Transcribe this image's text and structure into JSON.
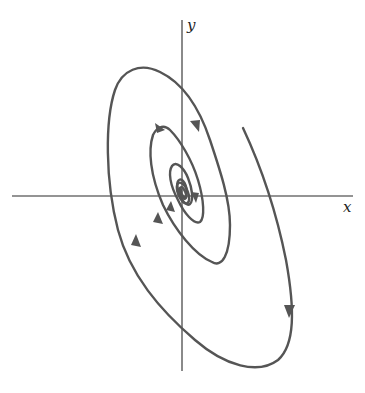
{
  "diagram": {
    "type": "phase-portrait",
    "axes": {
      "x_label": "x",
      "y_label": "y"
    },
    "colors": {
      "axis": "#2a2a2a",
      "trajectory": "#555555",
      "background": "#ffffff"
    },
    "equilibrium": {
      "type": "spiral-sink",
      "location": "origin"
    },
    "arrows_direction": "clockwise, inward"
  }
}
